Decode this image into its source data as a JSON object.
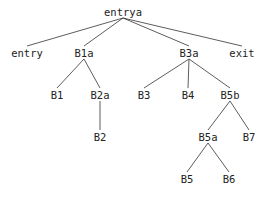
{
  "diagram": {
    "type": "tree",
    "line_color": "#333333",
    "text_color": "#222222",
    "nodes": [
      {
        "id": "entrya",
        "label": "entrya",
        "x": 123,
        "y": 12
      },
      {
        "id": "entry",
        "label": "entry",
        "x": 27,
        "y": 53
      },
      {
        "id": "B1a",
        "label": "B1a",
        "x": 84,
        "y": 53
      },
      {
        "id": "B3a",
        "label": "B3a",
        "x": 189,
        "y": 53
      },
      {
        "id": "exit",
        "label": "exit",
        "x": 242,
        "y": 53
      },
      {
        "id": "B1",
        "label": "B1",
        "x": 57,
        "y": 95
      },
      {
        "id": "B2a",
        "label": "B2a",
        "x": 100,
        "y": 95
      },
      {
        "id": "B3",
        "label": "B3",
        "x": 144,
        "y": 95
      },
      {
        "id": "B4",
        "label": "B4",
        "x": 188,
        "y": 95
      },
      {
        "id": "B5b",
        "label": "B5b",
        "x": 230,
        "y": 95
      },
      {
        "id": "B2",
        "label": "B2",
        "x": 100,
        "y": 137
      },
      {
        "id": "B5a",
        "label": "B5a",
        "x": 208,
        "y": 137
      },
      {
        "id": "B7",
        "label": "B7",
        "x": 249,
        "y": 137
      },
      {
        "id": "B5",
        "label": "B5",
        "x": 187,
        "y": 179
      },
      {
        "id": "B6",
        "label": "B6",
        "x": 229,
        "y": 179
      }
    ],
    "edges": [
      [
        "entrya",
        "entry"
      ],
      [
        "entrya",
        "B1a"
      ],
      [
        "entrya",
        "B3a"
      ],
      [
        "entrya",
        "exit"
      ],
      [
        "B1a",
        "B1"
      ],
      [
        "B1a",
        "B2a"
      ],
      [
        "B2a",
        "B2"
      ],
      [
        "B3a",
        "B3"
      ],
      [
        "B3a",
        "B4"
      ],
      [
        "B3a",
        "B5b"
      ],
      [
        "B5b",
        "B5a"
      ],
      [
        "B5b",
        "B7"
      ],
      [
        "B5a",
        "B5"
      ],
      [
        "B5a",
        "B6"
      ]
    ]
  }
}
